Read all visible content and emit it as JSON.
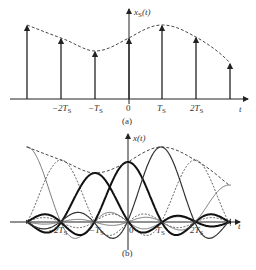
{
  "figure_a": {
    "y_label": "x_S(t)",
    "t_label": "t",
    "caption": "(a)",
    "ticks": [
      "-2T_S",
      "-T_S",
      "0",
      "T_S",
      "2T_S"
    ],
    "samples": [
      {
        "n": -3,
        "x": 27,
        "y": 25
      },
      {
        "n": -2,
        "x": 61,
        "y": 38
      },
      {
        "n": -1,
        "x": 95,
        "y": 51
      },
      {
        "n": 0,
        "x": 129,
        "y": 38
      },
      {
        "n": 1,
        "x": 162,
        "y": 25
      },
      {
        "n": 2,
        "x": 196,
        "y": 37
      },
      {
        "n": 3,
        "x": 230,
        "y": 63
      }
    ],
    "axis_y": 99
  },
  "figure_b": {
    "y_label": "x(t)",
    "t_label": "t",
    "caption": "(b)",
    "ticks": [
      "-2T_S",
      "-T_S",
      "0",
      "T_S",
      "2T_S"
    ],
    "axis_y": 222,
    "peaks": [
      {
        "n": -3,
        "x": 27,
        "y": 147,
        "style": "thin"
      },
      {
        "n": -2,
        "x": 61,
        "y": 160,
        "style": "dashed"
      },
      {
        "n": -1,
        "x": 95,
        "y": 173,
        "style": "bold"
      },
      {
        "n": 0,
        "x": 128,
        "y": 162,
        "style": "bold"
      },
      {
        "n": 1,
        "x": 161,
        "y": 147,
        "style": "medium"
      },
      {
        "n": 2,
        "x": 195,
        "y": 160,
        "style": "dashed"
      },
      {
        "n": 3,
        "x": 229,
        "y": 185,
        "style": "thin"
      }
    ]
  }
}
